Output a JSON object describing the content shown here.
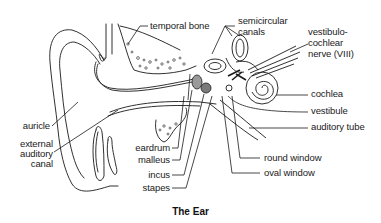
{
  "title": "The Ear",
  "labels": {
    "temporal_bone": "temporal bone",
    "semicircular_canals_1": "semicircular",
    "semicircular_canals_2": "canals",
    "vestibulocochlear_1": "vestibulo-",
    "vestibulocochlear_2": "cochlear",
    "vestibulocochlear_3": "nerve (VIII)",
    "cochlea": "cochlea",
    "vestibule": "vestibule",
    "auditory_tube": "auditory tube",
    "auricle": "auricle",
    "external_1": "external",
    "external_2": "auditory",
    "external_3": "canal",
    "eardrum": "eardrum",
    "malleus": "malleus",
    "incus": "incus",
    "stapes": "stapes",
    "round_window": "round window",
    "oval_window": "oval window"
  },
  "colors": {
    "line": "#1a1a1a",
    "background": "#ffffff",
    "ossicle_fill": "#9a9a9a"
  }
}
